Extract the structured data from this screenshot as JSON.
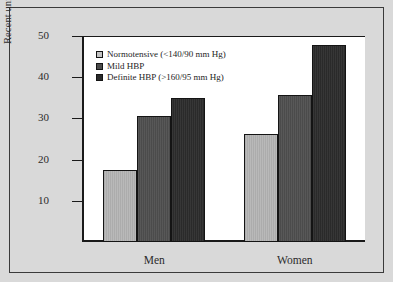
{
  "chart_data": {
    "type": "bar",
    "title": "",
    "xlabel": "",
    "ylabel": "Recent unrecognized myocardial infarctions, %",
    "categories": [
      "Men",
      "Women"
    ],
    "ylim": [
      0,
      50
    ],
    "yticks": [
      10,
      20,
      30,
      40,
      50
    ],
    "ytick_labels": [
      "10",
      "20",
      "30",
      "40",
      "50"
    ],
    "grid": false,
    "legend_position": "top-left",
    "series": [
      {
        "name": "Normotensive (<140/90 mm Hg)",
        "color": "#b9b9b9",
        "values": [
          17.6,
          26.1
        ]
      },
      {
        "name": "Mild HBP",
        "color": "#4b4b4b",
        "values": [
          30.7,
          35.7
        ]
      },
      {
        "name": "Definite HBP (>160/95 mm Hg)",
        "color": "#2a2a2a",
        "values": [
          34.9,
          47.8
        ]
      }
    ]
  },
  "figure": {
    "background_color": "#d9d9d9",
    "panel_color": "#ffffff",
    "axis_color": "#1a1a1a"
  }
}
